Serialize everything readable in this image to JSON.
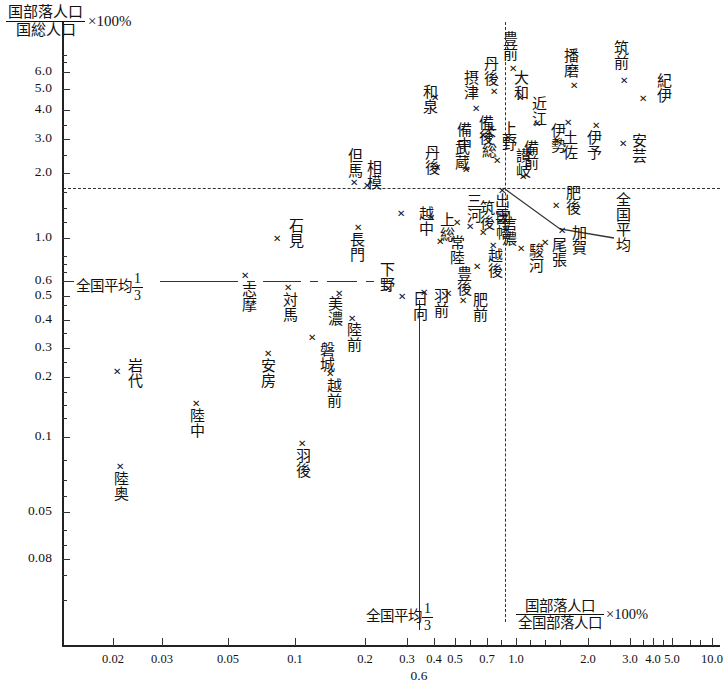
{
  "chart_data": {
    "type": "scatter",
    "title": "",
    "ylabel_num": "国部落人口",
    "ylabel_den": "国総人口",
    "ylabel_tail": "×100%",
    "xlabel_num": "国部落人口",
    "xlabel_den": "全国部落人口",
    "xlabel_tail": "×100%",
    "xlabel_sub": "0.6",
    "xticks": [
      "0.02",
      "0.03",
      "0.05",
      "0.1",
      "0.2",
      "0.3",
      "0.4",
      "0.5",
      "0.7",
      "1.0",
      "2.0",
      "3.0",
      "4.0",
      "5.0",
      "10.0"
    ],
    "yticks": [
      "6.0",
      "5.0",
      "4.0",
      "3.0",
      "2.0",
      "1.0",
      "0.6",
      "0.5",
      "0.4",
      "0.3",
      "0.2",
      "0.1",
      "0.05",
      "0.08"
    ],
    "xlim": [
      0.015,
      16.0
    ],
    "ylim": [
      0.02,
      8.0
    ],
    "xscale": "log",
    "yscale": "log",
    "grid": false,
    "reference_lines": [
      {
        "name": "horizontal-national-average",
        "orientation": "horizontal",
        "value": 1.8,
        "style": "dashed"
      },
      {
        "name": "vertical-national-average",
        "orientation": "vertical",
        "value": 1.85,
        "style": "dash-dot"
      },
      {
        "name": "vertical-national-average-third",
        "orientation": "vertical",
        "value": 0.62,
        "style": "dash-dot"
      },
      {
        "name": "horizontal-national-average-third",
        "orientation": "horizontal",
        "value": 0.6,
        "style": "dash-dot"
      }
    ],
    "annotations": {
      "left_avg_third": "全国平均",
      "left_avg_third_frac_num": "1",
      "left_avg_third_frac_den": "3",
      "bottom_avg_third": "全国平均",
      "bottom_avg_third_frac_num": "1",
      "bottom_avg_third_frac_den": "3",
      "callout_avg": "全国平均"
    },
    "points": [
      {
        "label": "和泉",
        "px": 435,
        "py": 97,
        "lx": 421,
        "ly": 84,
        "lpos": "left"
      },
      {
        "label": "摂津",
        "px": 476,
        "py": 108,
        "lx": 462,
        "ly": 70,
        "lpos": "left"
      },
      {
        "label": "丹後",
        "px": 494,
        "py": 91,
        "lx": 482,
        "ly": 56,
        "lpos": "left"
      },
      {
        "label": "豊前",
        "px": 513,
        "py": 68,
        "lx": 501,
        "ly": 31,
        "lpos": "left"
      },
      {
        "label": "大和",
        "px": 520,
        "py": 97,
        "lx": 512,
        "ly": 70,
        "lpos": "right"
      },
      {
        "label": "播磨",
        "px": 574,
        "py": 85,
        "lx": 562,
        "ly": 48,
        "lpos": "left"
      },
      {
        "label": "筑前",
        "px": 624,
        "py": 80,
        "lx": 612,
        "ly": 40,
        "lpos": "left"
      },
      {
        "label": "紀伊",
        "px": 643,
        "py": 98,
        "lx": 655,
        "ly": 73,
        "lpos": "right"
      },
      {
        "label": "近江",
        "px": 537,
        "py": 123,
        "lx": 530,
        "ly": 96,
        "lpos": "right"
      },
      {
        "label": "備後",
        "px": 491,
        "py": 128,
        "lx": 477,
        "ly": 115,
        "lpos": "left"
      },
      {
        "label": "備中",
        "px": 483,
        "py": 135,
        "lx": 455,
        "ly": 122,
        "lpos": "left"
      },
      {
        "label": "上野",
        "px": 508,
        "py": 137,
        "lx": 500,
        "ly": 121,
        "lpos": "right"
      },
      {
        "label": "伊勢",
        "px": 557,
        "py": 140,
        "lx": 549,
        "ly": 123,
        "lpos": "right"
      },
      {
        "label": "土佐",
        "px": 568,
        "py": 122,
        "lx": 561,
        "ly": 130,
        "lpos": "right"
      },
      {
        "label": "伊予",
        "px": 596,
        "py": 125,
        "lx": 585,
        "ly": 130,
        "lpos": "left"
      },
      {
        "label": "安芸",
        "px": 623,
        "py": 143,
        "lx": 630,
        "ly": 133,
        "lpos": "right"
      },
      {
        "label": "備前",
        "px": 530,
        "py": 153,
        "lx": 522,
        "ly": 140,
        "lpos": "right"
      },
      {
        "label": "讃岐",
        "px": 523,
        "py": 176,
        "lx": 514,
        "ly": 148,
        "lpos": "right"
      },
      {
        "label": "下総",
        "px": 497,
        "py": 160,
        "lx": 480,
        "ly": 128,
        "lpos": "left"
      },
      {
        "label": "武蔵",
        "px": 466,
        "py": 169,
        "lx": 453,
        "ly": 140,
        "lpos": "left"
      },
      {
        "label": "丹後2",
        "px": 437,
        "py": 167,
        "lx": 423,
        "ly": 145,
        "lpos": "left"
      },
      {
        "label": "但馬",
        "px": 354,
        "py": 182,
        "lx": 346,
        "ly": 148,
        "lpos": "left"
      },
      {
        "label": "相模",
        "px": 367,
        "py": 185,
        "lx": 365,
        "ly": 160,
        "lpos": "right"
      },
      {
        "label": "出雲",
        "px": 502,
        "py": 190,
        "lx": 493,
        "ly": 193,
        "lpos": "right"
      },
      {
        "label": "肥後",
        "px": 556,
        "py": 205,
        "lx": 564,
        "ly": 185,
        "lpos": "right"
      },
      {
        "label": "越中",
        "px": 401,
        "py": 213,
        "lx": 417,
        "ly": 206,
        "lpos": "right"
      },
      {
        "label": "上総",
        "px": 431,
        "py": 217,
        "lx": 438,
        "ly": 212,
        "lpos": "right"
      },
      {
        "label": "三河",
        "px": 457,
        "py": 222,
        "lx": 465,
        "ly": 193,
        "lpos": "right"
      },
      {
        "label": "筑後",
        "px": 470,
        "py": 226,
        "lx": 478,
        "ly": 200,
        "lpos": "right"
      },
      {
        "label": "因幡",
        "px": 483,
        "py": 232,
        "lx": 494,
        "ly": 210,
        "lpos": "right"
      },
      {
        "label": "石見",
        "px": 277,
        "py": 238,
        "lx": 287,
        "ly": 218,
        "lpos": "right"
      },
      {
        "label": "長門",
        "px": 358,
        "py": 227,
        "lx": 348,
        "ly": 232,
        "lpos": "left"
      },
      {
        "label": "常陸",
        "px": 440,
        "py": 241,
        "lx": 448,
        "ly": 235,
        "lpos": "right"
      },
      {
        "label": "加賀",
        "px": 562,
        "py": 230,
        "lx": 570,
        "ly": 225,
        "lpos": "right"
      },
      {
        "label": "尾張",
        "px": 545,
        "py": 242,
        "lx": 550,
        "ly": 237,
        "lpos": "right"
      },
      {
        "label": "駿河",
        "px": 521,
        "py": 248,
        "lx": 527,
        "ly": 243,
        "lpos": "right"
      },
      {
        "label": "信濃",
        "px": 493,
        "py": 245,
        "lx": 500,
        "ly": 216,
        "lpos": "right"
      },
      {
        "label": "越後",
        "px": 477,
        "py": 266,
        "lx": 486,
        "ly": 248,
        "lpos": "right"
      },
      {
        "label": "志摩",
        "px": 245,
        "py": 275,
        "lx": 240,
        "ly": 282,
        "lpos": "left"
      },
      {
        "label": "対馬",
        "px": 288,
        "py": 287,
        "lx": 281,
        "ly": 292,
        "lpos": "left"
      },
      {
        "label": "美濃",
        "px": 339,
        "py": 293,
        "lx": 326,
        "ly": 296,
        "lpos": "left"
      },
      {
        "label": "下野",
        "px": 388,
        "py": 288,
        "lx": 378,
        "ly": 262,
        "lpos": "left"
      },
      {
        "label": "日向",
        "px": 402,
        "py": 296,
        "lx": 411,
        "ly": 291,
        "lpos": "right"
      },
      {
        "label": "羽前",
        "px": 424,
        "py": 292,
        "lx": 432,
        "ly": 288,
        "lpos": "right"
      },
      {
        "label": "豊後",
        "px": 448,
        "py": 293,
        "lx": 455,
        "ly": 266,
        "lpos": "right"
      },
      {
        "label": "肥前",
        "px": 463,
        "py": 300,
        "lx": 471,
        "ly": 292,
        "lpos": "right"
      },
      {
        "label": "陸前",
        "px": 352,
        "py": 318,
        "lx": 345,
        "ly": 322,
        "lpos": "left"
      },
      {
        "label": "磐城",
        "px": 312,
        "py": 337,
        "lx": 318,
        "ly": 342,
        "lpos": "right"
      },
      {
        "label": "安房",
        "px": 268,
        "py": 353,
        "lx": 259,
        "ly": 358,
        "lpos": "left"
      },
      {
        "label": "越前",
        "px": 330,
        "py": 373,
        "lx": 325,
        "ly": 378,
        "lpos": "right"
      },
      {
        "label": "岩代",
        "px": 117,
        "py": 371,
        "lx": 126,
        "ly": 358,
        "lpos": "right"
      },
      {
        "label": "陸中",
        "px": 196,
        "py": 403,
        "lx": 188,
        "ly": 408,
        "lpos": "left"
      },
      {
        "label": "羽後",
        "px": 302,
        "py": 443,
        "lx": 294,
        "ly": 448,
        "lpos": "left"
      },
      {
        "label": "陸奥",
        "px": 120,
        "py": 466,
        "lx": 112,
        "ly": 471,
        "lpos": "left"
      }
    ],
    "marker_glyph": "✕"
  }
}
